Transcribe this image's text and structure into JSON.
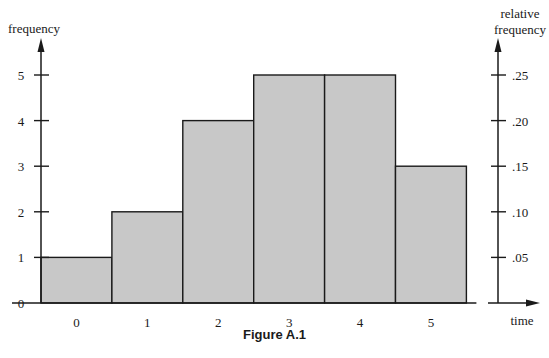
{
  "figure": {
    "caption": "Figure A.1"
  },
  "chart_data": {
    "type": "bar",
    "subtype": "histogram",
    "title": "",
    "caption": "Figure A.1",
    "categories": [
      "0",
      "1",
      "2",
      "3",
      "4",
      "5"
    ],
    "values": [
      1,
      2,
      4,
      5,
      5,
      3
    ],
    "relative_values": [
      0.05,
      0.1,
      0.2,
      0.25,
      0.25,
      0.15
    ],
    "xlabel": "time",
    "ylabel": "frequency",
    "ylabel_right": [
      "relative",
      "frequency"
    ],
    "ylim": [
      0,
      5
    ],
    "yticks": [
      "0",
      "1",
      "2",
      "3",
      "4",
      "5"
    ],
    "yticks_right": [
      ".05",
      ".10",
      ".15",
      ".20",
      ".25"
    ],
    "grid": false,
    "legend": null,
    "bar_fill": "#c8c8c8",
    "bar_stroke": "#1a1a1a"
  }
}
